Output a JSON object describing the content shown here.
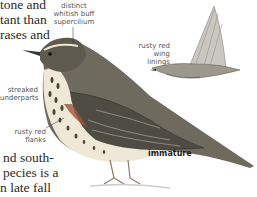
{
  "body_text_top": [
    "tone and",
    "tant than",
    "rases and"
  ],
  "body_text_bottom": [
    "nd south-",
    "pecies is a",
    "n late fall"
  ],
  "labels": {
    "supercilium": [
      "distinct",
      "whitish buff",
      "supercilium"
    ],
    "wing_linings": [
      "rusty red",
      "wing linings"
    ],
    "underparts": [
      "streaked",
      "underparts"
    ],
    "flanks": [
      "rusty red",
      "flanks"
    ],
    "age": "immature"
  },
  "colors": {
    "text": "#2a2a2a",
    "label": "#555555",
    "bird_back": "#6e6a5e",
    "bird_dark": "#3a3832",
    "flank_rust": "#a0563a",
    "breast": "#efe8d6"
  }
}
